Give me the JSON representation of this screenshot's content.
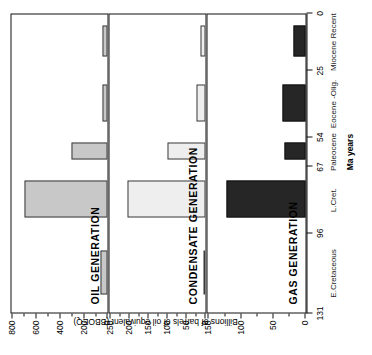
{
  "figure": {
    "value_axis_title": "Billions of barrels of oil equivalent (BBOEQ)",
    "category_axis_title": "Ma years"
  },
  "chart_data": {
    "type": "bar",
    "title": "",
    "xlabel": "Ma years",
    "ylabel": "Billions of barrels of oil equivalent (BBOEQ)",
    "orientation": "vertical-panels-rotated",
    "grid": false,
    "legend": "none",
    "categories": [
      "E.Cretaceous",
      "L.Cret.",
      "Paleocene",
      "Eocene -Olig.",
      "Miocene Recent"
    ],
    "category_boundaries_ma": [
      131,
      96,
      67,
      54,
      25,
      0
    ],
    "category_tick_labels": [
      "131",
      "96",
      "67",
      "54",
      "25",
      "0"
    ],
    "panels": [
      {
        "name": "oil",
        "title": "OIL GENERATION",
        "ylim": [
          0,
          800
        ],
        "yticks": [
          0,
          200,
          400,
          600,
          800
        ],
        "ytick_labels": [
          "0",
          "200",
          "400",
          "600",
          "800"
        ],
        "minor_ticks": [
          100,
          300,
          500,
          700
        ],
        "fill": "#c8c8c8",
        "stroke": "#3a3a3a",
        "values": [
          60,
          700,
          300,
          40,
          40
        ]
      },
      {
        "name": "condensate",
        "title": "CONDENSATE  GENERATION",
        "ylim": [
          0,
          250
        ],
        "yticks": [
          0,
          50,
          100,
          150,
          200,
          250
        ],
        "ytick_labels": [
          "0",
          "50",
          "100",
          "150",
          "200",
          "250"
        ],
        "minor_ticks": [
          25,
          75,
          125,
          175,
          225
        ],
        "fill": "#eeeeee",
        "stroke": "#3a3a3a",
        "values": [
          3,
          205,
          100,
          25,
          12
        ]
      },
      {
        "name": "gas",
        "title": "GAS GENERATION",
        "ylim": [
          0,
          150
        ],
        "yticks": [
          0,
          50,
          100,
          150
        ],
        "ytick_labels": [
          "0",
          "50",
          "100",
          "150"
        ],
        "minor_ticks": [
          25,
          75,
          125
        ],
        "fill": "#262626",
        "stroke": "#111111",
        "values": [
          0,
          122,
          33,
          35,
          18
        ]
      }
    ]
  }
}
